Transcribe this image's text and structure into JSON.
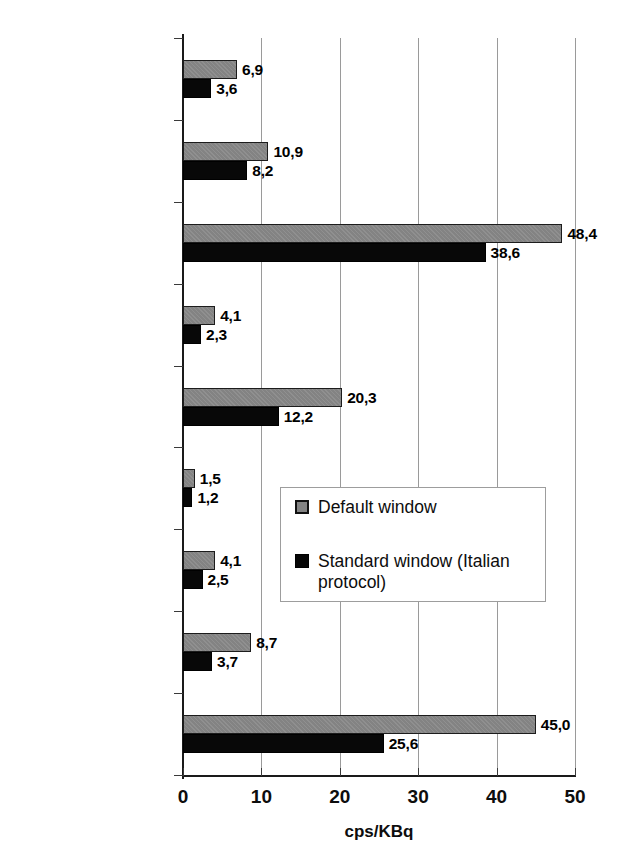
{
  "chart_data": {
    "type": "bar",
    "orientation": "horizontal",
    "title": "",
    "xlabel": "cps/KBq",
    "ylabel": "",
    "xlim": [
      0,
      50
    ],
    "xticks": [
      0,
      10,
      20,
      30,
      40,
      50
    ],
    "xtick_labels": [
      "0",
      "10",
      "20",
      "30",
      "40",
      "50"
    ],
    "grid": "vertical",
    "legend_position": "center-right",
    "decimal_separator": ",",
    "categories": [
      "Navigator",
      "Blue Tip 19mm (NO int. coll. & ext. coll)",
      "Blue Tip 19mm (NO int. coll.)",
      "Blue Tip 12mm (NO int. coll. & ext. coll)",
      "Blue Tip 12mm (NO int. coll.)",
      "Blue Tip 12mm (int. & ext. coll.)",
      "Blue Tip 12mm (int. coll.)",
      "Neoprobe 14mm (ext. coll.)",
      "Neoprobe 14mm"
    ],
    "category_lines": [
      [
        "Navigator"
      ],
      [
        "Blue Tip 19mm",
        "(NO int. coll. & ext.",
        "coll)"
      ],
      [
        "Blue Tip 19mm",
        "(NO int. coll.)"
      ],
      [
        "Blue Tip 12mm",
        "(NO int. coll. & ext.",
        "coll)"
      ],
      [
        "Blue Tip 12mm",
        "(NO int. coll.)"
      ],
      [
        "Blue Tip 12mm",
        "(int. & ext. coll.)"
      ],
      [
        "Blue Tip 12mm",
        "(int. coll.)"
      ],
      [
        "Neoprobe 14mm",
        "(ext. coll.)"
      ],
      [
        "Neoprobe 14mm"
      ]
    ],
    "series": [
      {
        "name": "Default window",
        "color": "#838383",
        "values": [
          6.9,
          10.9,
          48.4,
          4.1,
          20.3,
          1.5,
          4.1,
          8.7,
          45.0
        ],
        "labels": [
          "6,9",
          "10,9",
          "48,4",
          "4,1",
          "20,3",
          "1,5",
          "4,1",
          "8,7",
          "45,0"
        ]
      },
      {
        "name": "Standard window (Italian protocol)",
        "color": "#080808",
        "values": [
          3.6,
          8.2,
          38.6,
          2.3,
          12.2,
          1.2,
          2.5,
          3.7,
          25.6
        ],
        "labels": [
          "3,6",
          "8,2",
          "38,6",
          "2,3",
          "12,2",
          "1,2",
          "2,5",
          "3,7",
          "25,6"
        ]
      }
    ]
  },
  "legend": {
    "entries": [
      {
        "label": "Default window",
        "swatch": "default-window-swatch"
      },
      {
        "label": "Standard window (Italian protocol)",
        "swatch": "standard-window-swatch"
      }
    ]
  }
}
